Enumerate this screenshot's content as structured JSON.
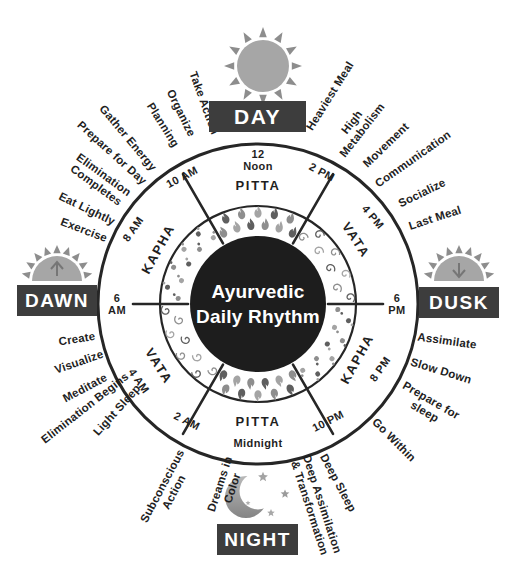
{
  "title": "Ayurvedic\nDaily Rhythm",
  "cardinals": {
    "day": "DAY",
    "dusk": "DUSK",
    "night": "NIGHT",
    "dawn": "DAWN"
  },
  "dosha_segments": [
    {
      "name": "PITTA",
      "symbol": "flames"
    },
    {
      "name": "VATA",
      "symbol": "spirals"
    },
    {
      "name": "KAPHA",
      "symbol": "dots"
    },
    {
      "name": "PITTA",
      "symbol": "flames"
    },
    {
      "name": "VATA",
      "symbol": "spirals"
    },
    {
      "name": "KAPHA",
      "symbol": "dots"
    }
  ],
  "times": [
    "12\nNoon",
    "2 PM",
    "4 PM",
    "6\nPM",
    "8 PM",
    "10 PM",
    "Midnight",
    "2 AM",
    "4 AM",
    "6\nAM",
    "8 AM",
    "10 AM"
  ],
  "activities": [
    "Heaviest Meal",
    "High\nMetabolism",
    "Movement",
    "Communication",
    "Socialize",
    "Last Meal",
    "Assimilate",
    "Slow Down",
    "Prepare for\nsleep",
    "Go Within",
    "Deep Sleep",
    "Deep Assimilation\n& Transformation",
    "Dreams in\nColor",
    "Subconscious\nAction",
    "Light Sleep",
    "Elimination Begins",
    "Meditate",
    "Visualize",
    "Create",
    "Exercise",
    "Eat Lightly",
    "Elimination\nCompletes",
    "Prepare for Day",
    "Gather Energy",
    "Planning",
    "Organize",
    "Take Action"
  ],
  "colors": {
    "ink": "#262626",
    "badge_bg": "#3d3d3d",
    "badge_text": "#ffffff",
    "center_disk": "#1d1d1d",
    "icon_gray": "#a6a6a6",
    "icon_gray_dark": "#8d8d8d",
    "symbol_gray": "#8e8e8e"
  }
}
